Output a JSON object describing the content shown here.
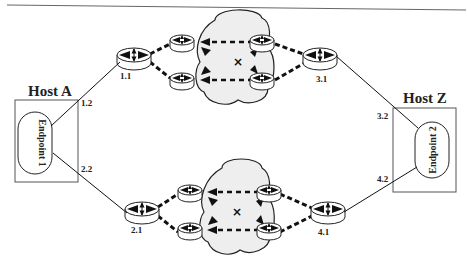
{
  "diagram": {
    "type": "network-topology",
    "hosts": [
      {
        "id": "host-a",
        "label": "Host A",
        "endpoint": "Endpoint 1"
      },
      {
        "id": "host-z",
        "label": "Host Z",
        "endpoint": "Endpoint 2"
      }
    ],
    "ports": {
      "p1_1": "1.1",
      "p1_2": "1.2",
      "p2_1": "2.1",
      "p2_2": "2.2",
      "p3_1": "3.1",
      "p3_2": "3.2",
      "p4_1": "4.1",
      "p4_2": "4.2"
    },
    "clouds": [
      {
        "id": "top-cloud",
        "routers": 4,
        "failed_marker": "×"
      },
      {
        "id": "bottom-cloud",
        "routers": 4,
        "failed_marker": "×"
      }
    ],
    "colors": {
      "line": "#1a1a1a",
      "cloud_fill": "#eeeeee",
      "router_fill": "#ffffff",
      "box_stroke": "#555555"
    }
  }
}
